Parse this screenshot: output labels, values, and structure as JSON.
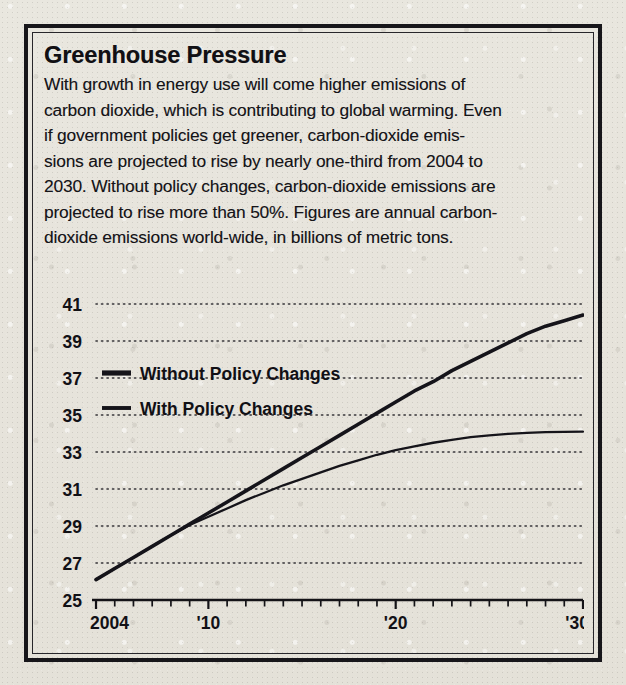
{
  "frame": {
    "background_color": "#e7e4dc",
    "border_color": "#17161a"
  },
  "headline": "Greenhouse Pressure",
  "deck_lines": [
    "With growth in energy use will come higher emissions of",
    "carbon dioxide, which is contributing to global warming. Even",
    "if government policies get greener, carbon-dioxide emis-",
    "sions are projected to rise by nearly one-third from 2004 to",
    "2030. Without policy changes, carbon-dioxide emissions are",
    "projected to rise more than 50%. Figures are annual carbon-",
    "dioxide emissions world-wide, in billions of metric tons."
  ],
  "chart_data": {
    "type": "line",
    "title": "Greenhouse Pressure",
    "xlabel": "",
    "ylabel": "",
    "grid": true,
    "legend_position": "inside-upper-left",
    "ylim": [
      25,
      41
    ],
    "xlim": [
      2004,
      2030
    ],
    "yticks": [
      41,
      39,
      37,
      35,
      33,
      31,
      29,
      27,
      25
    ],
    "ytick_labels": [
      "41",
      "39",
      "37",
      "35",
      "33",
      "31",
      "29",
      "27",
      "25"
    ],
    "xticks": [
      2004,
      2010,
      2020,
      2030
    ],
    "xtick_labels": [
      "2004",
      "'10",
      "'20",
      "'30"
    ],
    "x": [
      2004,
      2005,
      2006,
      2007,
      2008,
      2009,
      2010,
      2011,
      2012,
      2013,
      2014,
      2015,
      2016,
      2017,
      2018,
      2019,
      2020,
      2021,
      2022,
      2023,
      2024,
      2025,
      2026,
      2027,
      2028,
      2029,
      2030
    ],
    "series": [
      {
        "name": "Without Policy Changes",
        "line_width": 3.6,
        "color": "#15141a",
        "values": [
          26.1,
          26.7,
          27.3,
          27.9,
          28.5,
          29.1,
          29.7,
          30.3,
          30.9,
          31.5,
          32.1,
          32.7,
          33.3,
          33.9,
          34.5,
          35.1,
          35.7,
          36.3,
          36.8,
          37.4,
          37.9,
          38.4,
          38.9,
          39.4,
          39.8,
          40.1,
          40.4
        ]
      },
      {
        "name": "With Policy Changes",
        "line_width": 2.3,
        "color": "#15141a",
        "values": [
          26.1,
          26.7,
          27.3,
          27.9,
          28.5,
          29.05,
          29.5,
          29.95,
          30.4,
          30.8,
          31.2,
          31.55,
          31.9,
          32.25,
          32.55,
          32.85,
          33.1,
          33.3,
          33.5,
          33.65,
          33.8,
          33.9,
          33.98,
          34.03,
          34.07,
          34.09,
          34.1
        ]
      }
    ]
  },
  "legend": [
    {
      "label": "Without Policy Changes",
      "weight": "thick"
    },
    {
      "label": "With Policy Changes",
      "weight": "thin"
    }
  ]
}
